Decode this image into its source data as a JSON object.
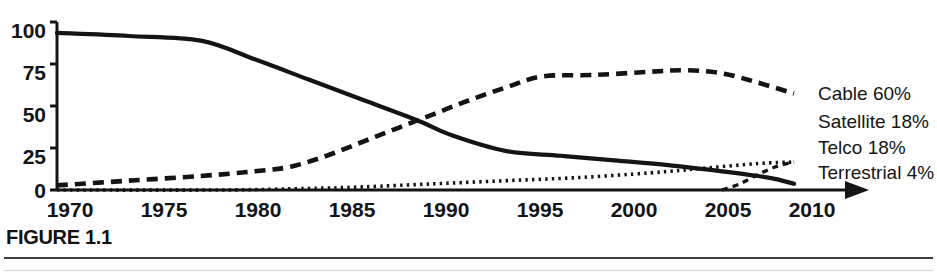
{
  "figure": {
    "caption_label": "FIGURE 1.1"
  },
  "chart_data": {
    "type": "line",
    "title": "",
    "xlabel": "",
    "ylabel": "",
    "xlim": [
      1969,
      2011
    ],
    "ylim": [
      0,
      108
    ],
    "grid": false,
    "legend_position": "right-inline-end-of-line",
    "x_ticks": [
      1970,
      1975,
      1980,
      1985,
      1990,
      1995,
      2000,
      2005,
      2010
    ],
    "y_ticks": [
      0,
      25,
      50,
      75,
      100
    ],
    "x_axis_arrow": true,
    "series": [
      {
        "name": "Terrestrial",
        "label": "Terrestrial 4%",
        "end_value": 4,
        "style": "solid",
        "x": [
          1969,
          1973,
          1977,
          1980,
          1983,
          1986,
          1989,
          1991,
          1994,
          1997,
          2000,
          2003,
          2006,
          2008,
          2009,
          2010
        ],
        "values": [
          101,
          99,
          96,
          84,
          71,
          58,
          45,
          35,
          25,
          22,
          19,
          16,
          12,
          9,
          7,
          4
        ]
      },
      {
        "name": "Cable",
        "label": "Cable 60%",
        "end_value": 60,
        "style": "dashed-bold",
        "x": [
          1969,
          1973,
          1977,
          1980,
          1982,
          1984,
          1986,
          1988,
          1990,
          1992,
          1994,
          1996,
          1999,
          2002,
          2004,
          2006,
          2008,
          2010
        ],
        "values": [
          3,
          6,
          9,
          12,
          15,
          22,
          31,
          40,
          49,
          58,
          66,
          73,
          74,
          76,
          77,
          75,
          69,
          62
        ]
      },
      {
        "name": "Satellite",
        "label": "Satellite 18%",
        "end_value": 18,
        "style": "dotted",
        "x": [
          1969,
          1978,
          1983,
          1986,
          1990,
          1994,
          1998,
          2002,
          2005,
          2008,
          2010
        ],
        "values": [
          0,
          0,
          1,
          2,
          4,
          6,
          8,
          11,
          14,
          17,
          18
        ]
      },
      {
        "name": "Telco",
        "label": "Telco 18%",
        "end_value": 18,
        "style": "dashed-fine",
        "x": [
          2006,
          2007,
          2008,
          2009,
          2010
        ],
        "values": [
          0,
          4,
          10,
          15,
          18
        ]
      }
    ]
  }
}
